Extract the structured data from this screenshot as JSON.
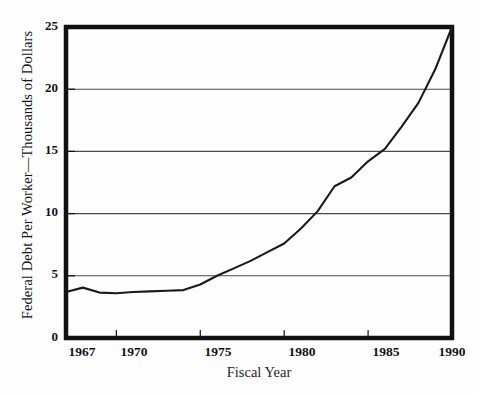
{
  "chart_data": {
    "type": "line",
    "title": "",
    "xlabel": "Fiscal Year",
    "ylabel": "Federal Debt Per Worker—Thousands of Dollars",
    "xlim": [
      1967,
      1990
    ],
    "ylim": [
      0,
      25
    ],
    "xticks": [
      1967,
      1970,
      1975,
      1980,
      1985,
      1990
    ],
    "xticklabels": [
      "1967",
      "1970",
      "1975",
      "1980",
      "1985",
      "1990"
    ],
    "yticks": [
      0,
      5,
      10,
      15,
      20,
      25
    ],
    "yticklabels": [
      "0",
      "5",
      "10",
      "15",
      "20",
      "25"
    ],
    "gridlines": {
      "horizontal": [
        5,
        10,
        15,
        20
      ],
      "vertical": []
    },
    "legend": null,
    "series": [
      {
        "name": "Federal Debt Per Worker",
        "x": [
          1967,
          1968,
          1969,
          1970,
          1971,
          1972,
          1973,
          1974,
          1975,
          1976,
          1977,
          1978,
          1979,
          1980,
          1981,
          1982,
          1983,
          1984,
          1985,
          1986,
          1987,
          1988,
          1989,
          1990
        ],
        "values": [
          3.7,
          4.05,
          3.65,
          3.6,
          3.7,
          3.75,
          3.8,
          3.85,
          4.3,
          5.0,
          5.6,
          6.2,
          6.9,
          7.6,
          8.8,
          10.2,
          12.2,
          12.9,
          14.2,
          15.2,
          17.0,
          18.9,
          21.6,
          25.0
        ]
      }
    ],
    "colors": {
      "line": "#1a1a1a",
      "frame": "#111111",
      "grid": "#4a4a4a",
      "background": "#fefefe",
      "text": "#121212"
    }
  },
  "axes": {
    "y_tick_0": "0",
    "y_tick_5": "5",
    "y_tick_10": "10",
    "y_tick_15": "15",
    "y_tick_20": "20",
    "y_tick_25": "25",
    "x_tick_1967": "1967",
    "x_tick_1970": "1970",
    "x_tick_1975": "1975",
    "x_tick_1980": "1980",
    "x_tick_1985": "1985",
    "x_tick_1990": "1990",
    "x_title": "Fiscal Year",
    "y_title": "Federal Debt Per Worker—Thousands of Dollars"
  }
}
